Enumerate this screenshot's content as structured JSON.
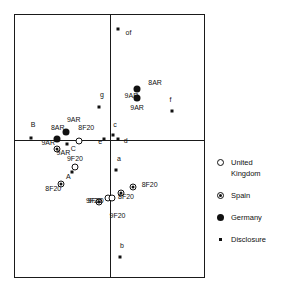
{
  "chart_data": {
    "type": "scatter",
    "title": "",
    "xlabel": "",
    "ylabel": "",
    "xlim": [
      0,
      100
    ],
    "ylim": [
      0,
      100
    ],
    "grid": false,
    "axis_origin": {
      "x": 50.2,
      "y": 52.3
    },
    "legend_position": "right",
    "legend": [
      {
        "key": "uk",
        "marker": "open-circle",
        "label": "United\nKingdom"
      },
      {
        "key": "spain",
        "marker": "circled-dot",
        "label": "Spain"
      },
      {
        "key": "germany",
        "marker": "filled-circle",
        "label": "Germany"
      },
      {
        "key": "disclosure",
        "marker": "small-square",
        "label": "Disclosure"
      }
    ],
    "series": [
      {
        "name": "Disclosure",
        "marker": "small-square",
        "points": [
          {
            "label": "of",
            "x": 54.7,
            "y": 94.5,
            "lx": 58.5,
            "ly": 94.5
          },
          {
            "label": "f",
            "x": 83.3,
            "y": 63.3,
            "lx": 81.8,
            "ly": 69.0
          },
          {
            "label": "g",
            "x": 44.3,
            "y": 64.8,
            "lx": 45.0,
            "ly": 71.0
          },
          {
            "label": "c",
            "x": 51.9,
            "y": 54.2,
            "lx": 52.0,
            "ly": 59.5
          },
          {
            "label": "d",
            "x": 54.7,
            "y": 52.5,
            "lx": 57.5,
            "ly": 53.6
          },
          {
            "label": "e",
            "x": 47.0,
            "y": 52.5,
            "lx": 44.0,
            "ly": 53.2
          },
          {
            "label": "B",
            "x": 8.3,
            "y": 53.0,
            "lx": 8.3,
            "ly": 59.5
          },
          {
            "label": "C",
            "x": 27.3,
            "y": 50.8,
            "lx": 29.5,
            "ly": 50.5
          },
          {
            "label": "A",
            "x": 30.0,
            "y": 40.2,
            "lx": 27.0,
            "ly": 39.8
          },
          {
            "label": "a",
            "x": 53.5,
            "y": 41.0,
            "lx": 54.0,
            "ly": 46.5
          },
          {
            "label": "b",
            "x": 55.5,
            "y": 7.5,
            "lx": 55.5,
            "ly": 13.5
          }
        ]
      },
      {
        "name": "Germany",
        "marker": "filled-circle",
        "points": [
          {
            "label": "8AR",
            "x": 64.4,
            "y": 71.8,
            "lx": 70.5,
            "ly": 75.5
          },
          {
            "label": "9AR",
            "x": 64.4,
            "y": 68.4,
            "lx": 58.0,
            "ly": 70.5
          },
          {
            "label": "9AR",
            "x": 64.4,
            "y": 68.4,
            "lx": 61.0,
            "ly": 66.0
          },
          {
            "label": "9AR",
            "x": 27.0,
            "y": 55.5,
            "lx": 27.5,
            "ly": 61.5
          },
          {
            "label": "8AR",
            "x": 22.0,
            "y": 52.5,
            "lx": 19.0,
            "ly": 58.5
          },
          {
            "label": "9AR",
            "x": 22.0,
            "y": 52.5,
            "lx": 14.0,
            "ly": 52.5
          }
        ]
      },
      {
        "name": "United Kingdom",
        "marker": "open-circle",
        "points": [
          {
            "label": "8F20",
            "x": 34.0,
            "y": 52.0,
            "lx": 33.5,
            "ly": 58.5
          },
          {
            "label": "9F20",
            "x": 31.5,
            "y": 42.0,
            "lx": 27.5,
            "ly": 46.5
          },
          {
            "label": "9F20",
            "x": 49.0,
            "y": 30.0,
            "lx": 37.5,
            "ly": 30.5
          },
          {
            "label": "9F20",
            "x": 51.5,
            "y": 30.0,
            "lx": 50.0,
            "ly": 25.0
          }
        ]
      },
      {
        "name": "Spain",
        "marker": "circled-dot",
        "points": [
          {
            "label": "9AR",
            "x": 22.0,
            "y": 49.0,
            "lx": 22.0,
            "ly": 49.0
          },
          {
            "label": "8F20",
            "x": 24.5,
            "y": 35.5,
            "lx": 16.0,
            "ly": 35.0
          },
          {
            "label": "8F20",
            "x": 62.5,
            "y": 34.5,
            "lx": 67.0,
            "ly": 36.5
          },
          {
            "label": "8F20",
            "x": 56.0,
            "y": 32.0,
            "lx": 54.5,
            "ly": 32.0
          },
          {
            "label": "9F20",
            "x": 44.5,
            "y": 28.5,
            "lx": 38.5,
            "ly": 30.5
          }
        ]
      }
    ]
  }
}
